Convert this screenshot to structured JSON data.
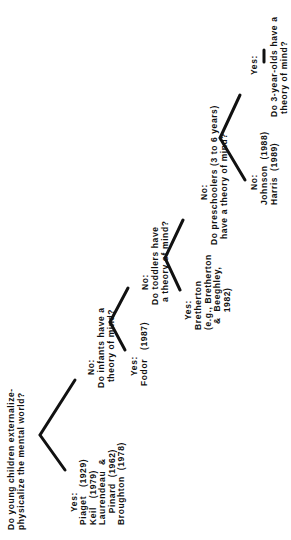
{
  "diagram": {
    "root": {
      "question": "Do young children externalize-\nphysicalize the mental world?",
      "yes": {
        "label": "Yes:",
        "refs": "Piaget   (1929)\nKeil   (1979)\nLaurendeau  &\n    Pinard  (1962)\nBroughton  (1978)"
      },
      "no_label": "No:"
    },
    "infants": {
      "question": "Do infants have a\n  theory of mind?",
      "yes": {
        "label": "Yes:",
        "refs": "Fodor   (1987)"
      },
      "no_label": "No:"
    },
    "toddlers": {
      "question": "Do toddlers have\n a theory of mind?",
      "yes": {
        "label": "Yes:",
        "refs": "Bretherton\n(e.g., Bretherton\n  &  Beeghley,\n      1982)"
      },
      "no_label": "No:"
    },
    "preschoolers": {
      "question": "Do preschoolers (3 to 6 years)\n  have a theory of mind?",
      "no": {
        "label": "No:",
        "refs": "Johnson  (1988)\nHarris  (1989)"
      },
      "yes_label": "Yes:"
    },
    "three_year_olds": {
      "question": "Do 3-year-olds have a\n theory of mind?"
    }
  }
}
